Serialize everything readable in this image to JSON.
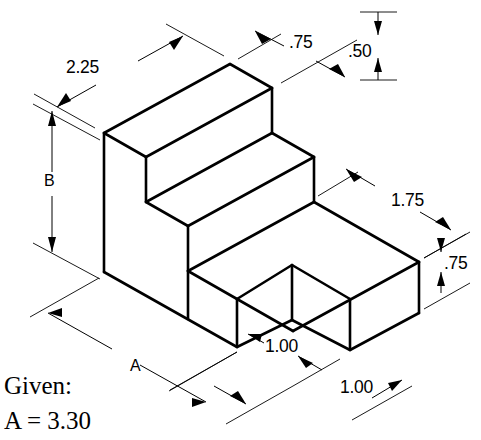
{
  "drawing": {
    "type": "isometric-pictorial",
    "object": "stepped-block-with-notch",
    "background_color": "#ffffff",
    "line_color": "#000000"
  },
  "dimensions": [
    {
      "id": "top-left",
      "label": "2.25",
      "orientation": "iso-left",
      "text_x": 66,
      "text_y": 73
    },
    {
      "id": "top-middle",
      "label": ".75",
      "orientation": "iso-right",
      "text_x": 289,
      "text_y": 48
    },
    {
      "id": "top-right",
      "label": ".50",
      "orientation": "vertical",
      "text_x": 348,
      "text_y": 57
    },
    {
      "id": "left-height",
      "label": "B",
      "orientation": "vertical",
      "text_x": 44,
      "text_y": 186
    },
    {
      "id": "right-depth",
      "label": "1.75",
      "orientation": "iso-right",
      "text_x": 391,
      "text_y": 206
    },
    {
      "id": "right-height",
      "label": ".75",
      "orientation": "vertical",
      "text_x": 444,
      "text_y": 262
    },
    {
      "id": "bottom-notch",
      "label": "1.00",
      "orientation": "leader",
      "text_x": 265,
      "text_y": 352
    },
    {
      "id": "bottom-right",
      "label": "1.00",
      "orientation": "iso-right",
      "text_x": 340,
      "text_y": 393
    },
    {
      "id": "bottom-length",
      "label": "A",
      "orientation": "iso-left",
      "text_x": 130,
      "text_y": 365
    }
  ],
  "notes": {
    "given_label": "Given:",
    "given_value": "A = 3.30"
  }
}
